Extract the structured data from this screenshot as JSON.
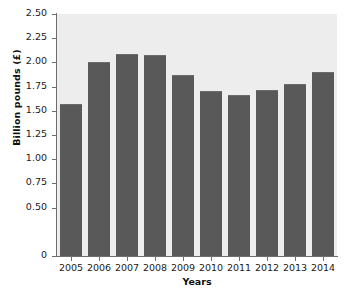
{
  "chart_data": {
    "type": "bar",
    "title": "",
    "xlabel": "Years",
    "ylabel": "Billion pounds (£)",
    "categories": [
      "2005",
      "2006",
      "2007",
      "2008",
      "2009",
      "2010",
      "2011",
      "2012",
      "2013",
      "2014"
    ],
    "values": [
      1.57,
      2.0,
      2.09,
      2.08,
      1.87,
      1.7,
      1.66,
      1.71,
      1.78,
      1.9
    ],
    "ylim": [
      0,
      2.5
    ],
    "ytick_labels": [
      "2.50",
      "2.25",
      "2.00",
      "1.75",
      "1.50",
      "1.25",
      "1.00",
      "0.75",
      "0.50",
      "0"
    ],
    "ytick_values": [
      2.5,
      2.25,
      2.0,
      1.75,
      1.5,
      1.25,
      1.0,
      0.75,
      0.5,
      0
    ],
    "grid": false,
    "legend": "none",
    "bar_color": "#595959",
    "plot_background": "#ededed",
    "page_background": "#ffffff",
    "axis_color": "#6e6e6e"
  }
}
